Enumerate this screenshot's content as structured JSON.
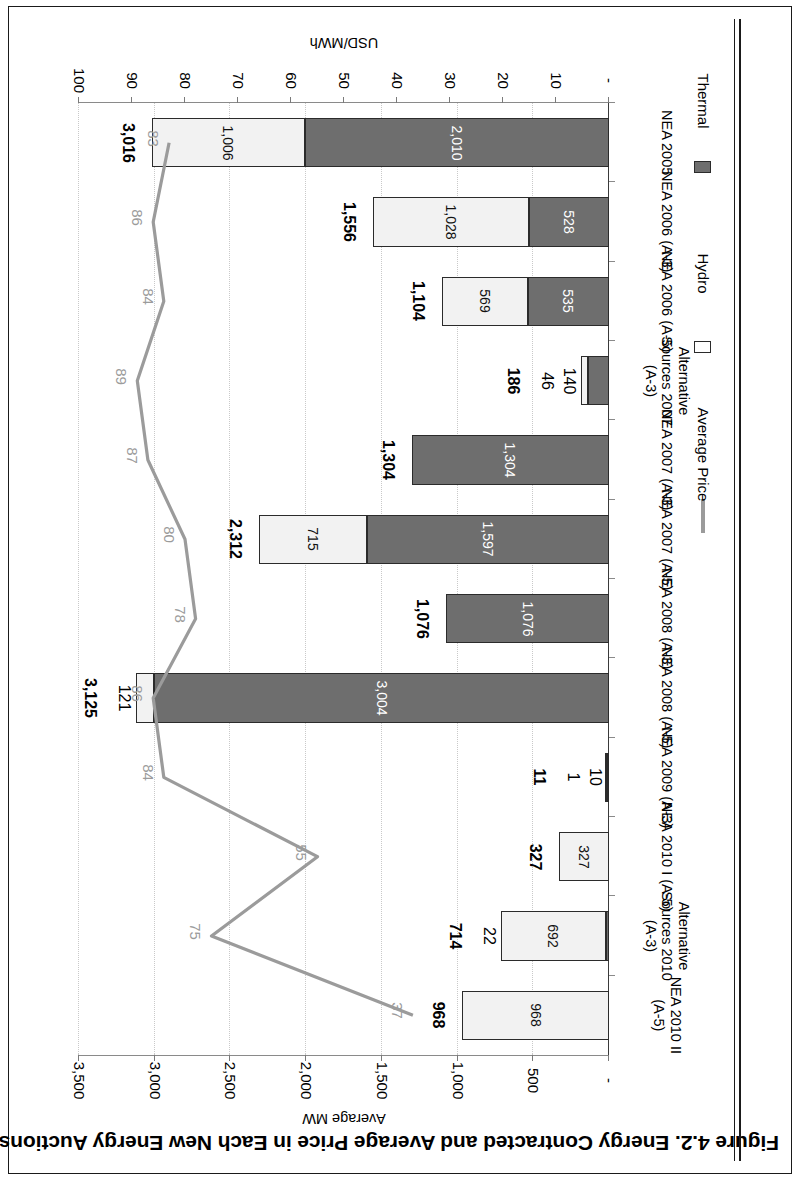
{
  "figure": {
    "title": "Figure 4.2.  Energy Contracted and Average Price in Each New Energy Auctions (NEA)"
  },
  "axes": {
    "value_axis_title": "Average MW",
    "secondary_axis_title": "USD/MWh",
    "mw_ticks": [
      "-",
      "500",
      "1,000",
      "1,500",
      "2,000",
      "2,500",
      "3,000",
      "3,500"
    ],
    "usd_ticks": [
      "-",
      "10",
      "20",
      "30",
      "40",
      "50",
      "60",
      "70",
      "80",
      "90",
      "100"
    ]
  },
  "legend": {
    "items": [
      {
        "label": "Thermal",
        "type": "swatch",
        "color": "#6e6e6e"
      },
      {
        "label": "Hydro",
        "type": "swatch",
        "color": "#ffffff"
      },
      {
        "label": "Average Price",
        "type": "line",
        "color": "#9b9b9b"
      }
    ]
  },
  "chart_data": {
    "type": "bar",
    "title": "Figure 4.2.  Energy Contracted and Average Price in Each New Energy Auctions (NEA)",
    "xlabel": "",
    "ylabel": "Average MW",
    "y2label": "USD/MWh",
    "ylim": [
      0,
      3500
    ],
    "y2lim": [
      0,
      100
    ],
    "grid": true,
    "legend_position": "top-left",
    "orientation": "horizontal-rotated-180",
    "categories": [
      "NEA 2005",
      "NEA 2006 (A-3)",
      "NEA 2006 (A-5)",
      "Alternative Sources 2007 (A-3)",
      "NEA 2007 (A-3)",
      "NEA 2007 (A-5)",
      "NEA 2008 (A-3)",
      "NEA 2008 (A-5)",
      "NEA 2009 (A-3)",
      "NEA 2010 I (A-5)",
      "Alternative Sources 2010 (A-3)",
      "NEA 2010 II (A-5)"
    ],
    "category_lines": [
      [
        "NEA 2005"
      ],
      [
        "NEA 2006 (A-3)"
      ],
      [
        "NEA 2006 (A-5)"
      ],
      [
        "Alternative",
        "Sources 2007",
        "(A-3)"
      ],
      [
        "NEA 2007 (A-3)"
      ],
      [
        "NEA 2007 (A-5)"
      ],
      [
        "NEA 2008 (A-3)"
      ],
      [
        "NEA 2008 (A-5)"
      ],
      [
        "NEA 2009 (A-3)"
      ],
      [
        "NEA 2010 I (A-5)"
      ],
      [
        "Alternative",
        "Sources 2010",
        "(A-3)"
      ],
      [
        "NEA 2010 II",
        "(A-5)"
      ]
    ],
    "series": [
      {
        "name": "Thermal",
        "values": [
          2010,
          528,
          535,
          140,
          1304,
          1597,
          1076,
          3004,
          10,
          0,
          22,
          0
        ],
        "labels": [
          "2,010",
          "528",
          "535",
          "140",
          "1,304",
          "1,597",
          "1,076",
          "3,004",
          "10",
          "-",
          "22",
          ""
        ]
      },
      {
        "name": "Hydro",
        "values": [
          1006,
          1028,
          569,
          46,
          0,
          715,
          0,
          121,
          1,
          327,
          692,
          968
        ],
        "labels": [
          "1,006",
          "1,028",
          "569",
          "46",
          "",
          "715",
          "",
          "121",
          "1",
          "327",
          "692",
          "968"
        ]
      },
      {
        "name": "Average Price",
        "values": [
          83,
          86,
          84,
          89,
          87,
          80,
          78,
          86,
          84,
          55,
          75,
          37
        ],
        "labels": [
          "83",
          "86",
          "84",
          "89",
          "87",
          "80",
          "78",
          "86",
          "84",
          "55",
          "75",
          "37"
        ]
      }
    ],
    "totals": [
      3016,
      1556,
      1104,
      186,
      1304,
      2312,
      1076,
      3125,
      11,
      327,
      714,
      968
    ],
    "total_labels": [
      "3,016",
      "1,556",
      "1,104",
      "186",
      "1,304",
      "2,312",
      "1,076",
      "3,125",
      "11",
      "327",
      "714",
      "968"
    ]
  }
}
